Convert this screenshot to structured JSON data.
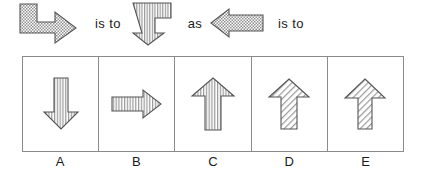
{
  "puzzle": {
    "type": "visual-analogy",
    "relation_labels": {
      "is_to_1": "is to",
      "as": "as",
      "is_to_2": "is to"
    },
    "stems": [
      {
        "id": "stem-a",
        "name": "bent-arrow-right-stippled",
        "direction": "right",
        "shape": "bent-L",
        "fill_pattern": "stipple",
        "outline_color": "#4d4d4d",
        "fill_color": "#b5b5b5"
      },
      {
        "id": "stem-b",
        "name": "bent-arrow-down-striped",
        "direction": "down",
        "shape": "bent-L",
        "fill_pattern": "vertical-stripes",
        "outline_color": "#4d4d4d",
        "fill_color": "#ffffff"
      },
      {
        "id": "stem-c",
        "name": "straight-arrow-left-stippled",
        "direction": "left",
        "shape": "straight",
        "fill_pattern": "stipple",
        "outline_color": "#4d4d4d",
        "fill_color": "#b5b5b5"
      }
    ],
    "options": [
      {
        "letter": "A",
        "name": "arrow-down-vertical-stripes",
        "direction": "down",
        "shape": "straight",
        "fill_pattern": "vertical-stripes",
        "shaft_width": "medium"
      },
      {
        "letter": "B",
        "name": "arrow-right-vertical-stripes",
        "direction": "right",
        "shape": "straight",
        "fill_pattern": "vertical-stripes",
        "shaft_width": "medium"
      },
      {
        "letter": "C",
        "name": "arrow-up-vertical-stripes",
        "direction": "up",
        "shape": "straight",
        "fill_pattern": "vertical-stripes",
        "shaft_width": "wide"
      },
      {
        "letter": "D",
        "name": "arrow-up-diagonal-hatch",
        "direction": "up",
        "shape": "straight",
        "fill_pattern": "diagonal-hatch",
        "shaft_width": "medium"
      },
      {
        "letter": "E",
        "name": "arrow-up-diagonal-hatch-narrow",
        "direction": "up",
        "shape": "straight",
        "fill_pattern": "diagonal-hatch",
        "shaft_width": "narrow"
      }
    ]
  },
  "colors": {
    "box_border": "#8a8a8a",
    "shape_outline": "#4d4d4d",
    "text": "#1a1a1a",
    "background": "#ffffff",
    "stipple_fill": "#b5b5b5"
  }
}
